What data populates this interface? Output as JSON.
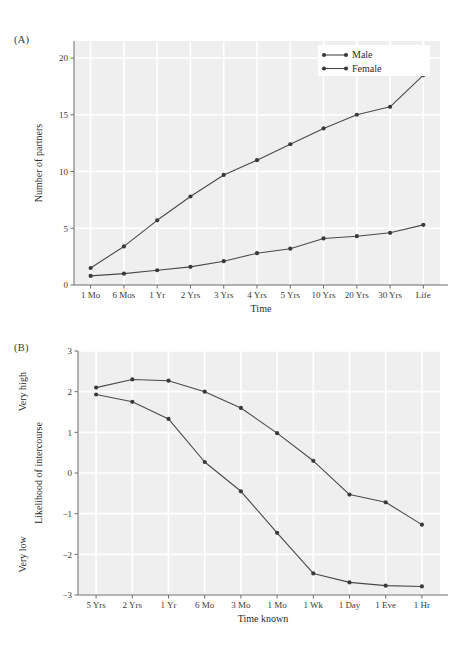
{
  "figure": {
    "panels": [
      {
        "tag": "(A)"
      },
      {
        "tag": "(B)"
      }
    ]
  },
  "colors": {
    "plot_background": "#efefef",
    "gridline": "#ffffff",
    "series_line": "#4a4a4a",
    "marker": "#3a3a3a",
    "axis": "#6d6d6d",
    "text": "#2b2b2b",
    "page_background": "#ffffff",
    "legend_background": "#ffffff"
  },
  "chart_data": [
    {
      "type": "line",
      "panel": "(A)",
      "title": "",
      "xlabel": "Time",
      "ylabel": "Number of partners",
      "categories": [
        "1 Mo",
        "6 Mos",
        "1 Yr",
        "2 Yrs",
        "3 Yrs",
        "4 Yrs",
        "5 Yrs",
        "10 Yrs",
        "20 Yrs",
        "30 Yrs",
        "Life"
      ],
      "yticks": [
        0,
        5,
        10,
        15,
        20
      ],
      "ylim": [
        0,
        21.5
      ],
      "grid": true,
      "legend": {
        "position": "top-right",
        "entries": [
          "Male",
          "Female"
        ]
      },
      "series": [
        {
          "name": "Male",
          "values": [
            1.5,
            3.4,
            5.7,
            7.8,
            9.7,
            11.0,
            12.4,
            13.8,
            15.0,
            15.7,
            18.5
          ]
        },
        {
          "name": "Female",
          "values": [
            0.8,
            1.0,
            1.3,
            1.6,
            2.1,
            2.8,
            3.2,
            4.1,
            4.3,
            4.6,
            5.3
          ]
        }
      ]
    },
    {
      "type": "line",
      "panel": "(B)",
      "title": "",
      "xlabel": "Time known",
      "ylabel": "Likelihood of intercourse",
      "y_annotations": [
        {
          "text": "Very high",
          "value": 2
        },
        {
          "text": "Very low",
          "value": -2
        }
      ],
      "categories": [
        "5 Yrs",
        "2 Yrs",
        "1 Yr",
        "6 Mo",
        "3 Mo",
        "1 Mo",
        "1 Wk",
        "1 Day",
        "1 Eve",
        "1 Hr"
      ],
      "yticks": [
        3,
        2,
        1,
        0,
        -1,
        -2,
        -3
      ],
      "ylim": [
        -3,
        3
      ],
      "grid": true,
      "legend": null,
      "series": [
        {
          "name": "Male",
          "values": [
            2.1,
            2.3,
            2.27,
            2.0,
            1.6,
            0.98,
            0.3,
            -0.53,
            -0.72,
            -1.27
          ]
        },
        {
          "name": "Female",
          "values": [
            1.93,
            1.75,
            1.33,
            0.27,
            -0.45,
            -1.47,
            -2.47,
            -2.69,
            -2.77,
            -2.79
          ]
        }
      ]
    }
  ]
}
